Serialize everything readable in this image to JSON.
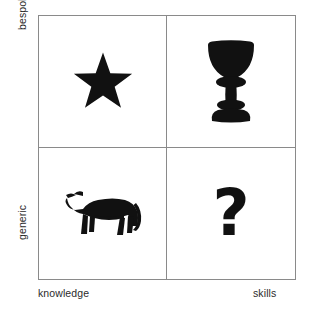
{
  "figure": {
    "title": "",
    "type": "2x2-matrix",
    "background_color": "#ffffff",
    "grid_line_color": "#8a8a8a",
    "glyph_color": "#111111",
    "text_color": "#2b2b2b"
  },
  "y_axis": {
    "top_label": "bespoke",
    "bottom_label": "generic"
  },
  "x_axis": {
    "left_label": "knowledge",
    "right_label": "skills"
  },
  "quadrants": [
    {
      "position": "top-left",
      "x": "knowledge",
      "y": "bespoke",
      "icon": "star-icon",
      "icon_label": "star"
    },
    {
      "position": "top-right",
      "x": "skills",
      "y": "bespoke",
      "icon": "chalice-icon",
      "icon_label": "chalice"
    },
    {
      "position": "bottom-left",
      "x": "knowledge",
      "y": "generic",
      "icon": "cow-icon",
      "icon_label": "cow"
    },
    {
      "position": "bottom-right",
      "x": "skills",
      "y": "generic",
      "icon": "question-mark-icon",
      "icon_label": "?"
    }
  ]
}
